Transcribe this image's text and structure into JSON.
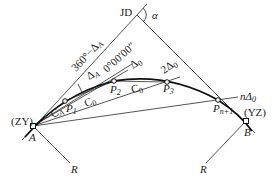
{
  "diagram": {
    "labels": {
      "jd": "JD",
      "alpha": "α",
      "zy": "(ZY)",
      "yz": "(YZ)",
      "a": "A",
      "b": "B",
      "r_left": "R",
      "r_right": "R",
      "p1": "P",
      "p1_sub": "1",
      "p2": "P",
      "p2_sub": "2",
      "p3": "P",
      "p3_sub": "3",
      "pn1": "P",
      "pn1_sub": "n+1",
      "angle_360": "360°−Δ",
      "angle_360_sub": "A",
      "delta_a": "Δ",
      "delta_a_sub": "A",
      "zero_dir": "0°00′00″",
      "delta0": "Δ",
      "delta0_sub": "0",
      "two_delta0": "2Δ",
      "two_delta0_sub": "0",
      "n_delta0": "nΔ",
      "n_delta0_sub": "0",
      "ca": "C",
      "ca_sub": "A",
      "c0_a": "C",
      "c0_a_sub": "0",
      "c0_b": "C",
      "c0_b_sub": "0"
    },
    "colors": {
      "line": "#2a2a2a",
      "curve": "#111111",
      "background": "#ffffff"
    }
  }
}
